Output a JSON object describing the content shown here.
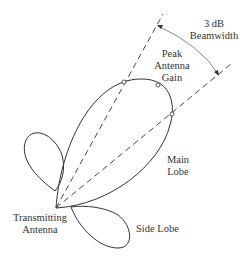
{
  "diagram": {
    "type": "antenna radiation pattern",
    "labels": {
      "beamwidth_line1": "3 dB",
      "beamwidth_line2": "Beamwidth",
      "peak_line1": "Peak",
      "peak_line2": "Antenna",
      "peak_line3": "Gain",
      "main_line1": "Main",
      "main_line2": "Lobe",
      "tx_line1": "Transmitting",
      "tx_line2": "Antenna",
      "side_lobe": "Side Lobe"
    },
    "colors": {
      "stroke": "#333333",
      "arrow": "#888888"
    }
  }
}
